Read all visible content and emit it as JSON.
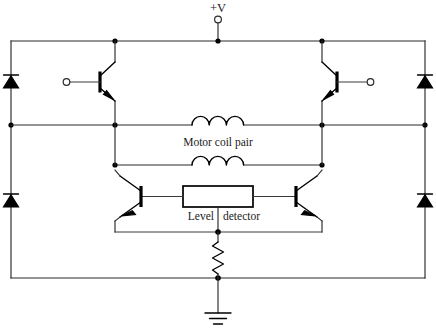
{
  "diagram": {
    "background_color": "#ffffff",
    "line_color": "#2b2b2b",
    "labels": {
      "supply": "+V",
      "motor_coil": "Motor coil pair",
      "level_left": "Level",
      "level_right": "detector"
    },
    "components": {
      "supply_terminal": "supply-terminal-circle",
      "diode_top_left": "diode",
      "diode_top_right": "diode",
      "diode_bottom_left": "diode",
      "diode_bottom_right": "diode",
      "transistor_top_left": "npn-transistor",
      "transistor_top_right": "npn-transistor",
      "transistor_bottom_left": "npn-transistor",
      "transistor_bottom_right": "npn-transistor",
      "inductor_upper": "inductor-coil",
      "inductor_lower": "inductor-coil",
      "level_detector": "level-detector-box",
      "sense_resistor": "resistor",
      "ground": "ground-symbol",
      "input_terminal_left": "input-terminal-circle",
      "input_terminal_right": "input-terminal-circle"
    }
  }
}
